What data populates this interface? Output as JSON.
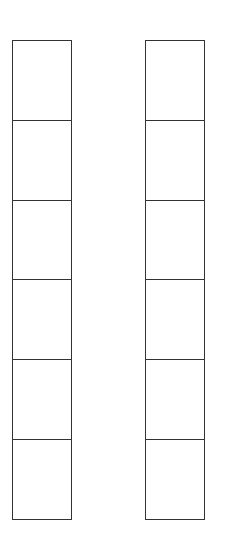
{
  "diagram": {
    "type": "two empty box columns",
    "columns": [
      {
        "name": "left",
        "cells": [
          "",
          "",
          "",
          "",
          "",
          ""
        ]
      },
      {
        "name": "right",
        "cells": [
          "",
          "",
          "",
          "",
          "",
          ""
        ]
      }
    ],
    "line_color": "#333333",
    "background": "#ffffff"
  }
}
